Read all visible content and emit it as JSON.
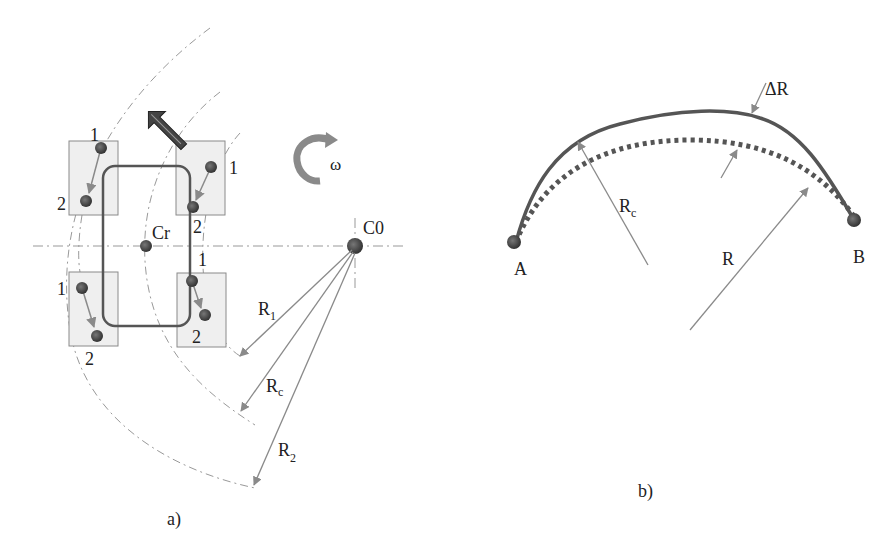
{
  "panel_a": {
    "caption": "a)",
    "center_rotation_label": "Cr",
    "center_curve_label": "C0",
    "omega_label": "ω",
    "wheels": [
      {
        "name": "front-left",
        "label_1": "1",
        "label_2": "2"
      },
      {
        "name": "front-right",
        "label_1": "1",
        "label_2": "2"
      },
      {
        "name": "rear-left",
        "label_1": "1",
        "label_2": "2"
      },
      {
        "name": "rear-right",
        "label_1": "1",
        "label_2": "2"
      }
    ],
    "radii": [
      {
        "base": "R",
        "sub": "1"
      },
      {
        "base": "R",
        "sub": "c"
      },
      {
        "base": "R",
        "sub": "2"
      }
    ]
  },
  "panel_b": {
    "caption": "b)",
    "point_a": "A",
    "point_b": "B",
    "rc_label": {
      "base": "R",
      "sub": "c"
    },
    "r_label": "R",
    "delta_r_label": "ΔR"
  },
  "colors": {
    "dark": "#3a3a3a",
    "mid_gray": "#8a8a8a",
    "box_fill": "#efefef",
    "box_stroke": "#8a8a8a",
    "dash": "#999999"
  }
}
